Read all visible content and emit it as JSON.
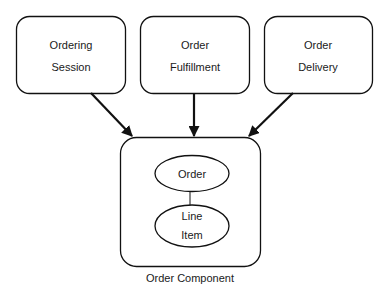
{
  "diagram": {
    "top_nodes": [
      {
        "id": "ordering-session",
        "line1": "Ordering",
        "line2": "Session"
      },
      {
        "id": "order-fulfillment",
        "line1": "Order",
        "line2": "Fulfillment"
      },
      {
        "id": "order-delivery",
        "line1": "Order",
        "line2": "Delivery"
      }
    ],
    "component": {
      "caption": "Order Component",
      "inner_nodes": [
        {
          "id": "order",
          "line1": "Order"
        },
        {
          "id": "line-item",
          "line1": "Line",
          "line2": "Item"
        }
      ]
    },
    "edges": [
      {
        "from": "ordering-session",
        "to": "order-component",
        "type": "arrow"
      },
      {
        "from": "order-fulfillment",
        "to": "order-component",
        "type": "arrow"
      },
      {
        "from": "order-delivery",
        "to": "order-component",
        "type": "arrow"
      },
      {
        "from": "order",
        "to": "line-item",
        "type": "line"
      }
    ]
  }
}
